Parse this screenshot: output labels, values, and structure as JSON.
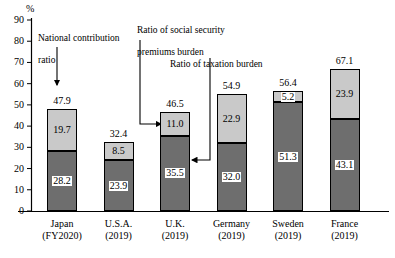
{
  "chart_data": {
    "type": "bar",
    "subtype": "stacked-column",
    "title": "",
    "xlabel": "",
    "ylabel": "%",
    "ylim": [
      0,
      90
    ],
    "yticks": [
      0,
      10,
      20,
      30,
      40,
      50,
      60,
      70,
      80,
      90
    ],
    "grid": false,
    "legend_position": "annotations",
    "categories": [
      "Japan",
      "U.S.A.",
      "U.K.",
      "Germany",
      "Sweden",
      "France"
    ],
    "category_years": [
      "(FY2020)",
      "(2019)",
      "(2019)",
      "(2019)",
      "(2019)",
      "(2019)"
    ],
    "series": [
      {
        "name": "Ratio of taxation burden",
        "key": "taxation",
        "color": "#6e6e6e",
        "values": [
          28.2,
          23.9,
          35.5,
          32.0,
          51.3,
          43.1
        ]
      },
      {
        "name": "Ratio of social security premiums burden",
        "key": "social_security",
        "color": "#c9c9c9",
        "values": [
          19.7,
          8.5,
          11.0,
          22.9,
          5.2,
          23.9
        ]
      }
    ],
    "totals": [
      47.9,
      32.4,
      46.5,
      54.9,
      56.4,
      67.1
    ],
    "total_label_name": "National contribution ratio",
    "annotations": [
      {
        "id": "national-contribution-ratio",
        "text": "National contribution\nratio"
      },
      {
        "id": "social-security-premiums-burden",
        "text": "Ratio of social security\npremiums burden"
      },
      {
        "id": "taxation-burden",
        "text": "Ratio of taxation burden"
      }
    ]
  },
  "axis": {
    "unit": "%",
    "ticks": [
      "90",
      "80",
      "70",
      "60",
      "50",
      "40",
      "30",
      "20",
      "10",
      "0"
    ]
  },
  "bars": [
    {
      "name": "Japan",
      "year": "(FY2020)",
      "total": "47.9",
      "light": "19.7",
      "dark": "28.2"
    },
    {
      "name": "U.S.A.",
      "year": "(2019)",
      "total": "32.4",
      "light": "8.5",
      "dark": "23.9"
    },
    {
      "name": "U.K.",
      "year": "(2019)",
      "total": "46.5",
      "light": "11.0",
      "dark": "35.5"
    },
    {
      "name": "Germany",
      "year": "(2019)",
      "total": "54.9",
      "light": "22.9",
      "dark": "32.0"
    },
    {
      "name": "Sweden",
      "year": "(2019)",
      "total": "56.4",
      "light": "5.2",
      "dark": "51.3"
    },
    {
      "name": "France",
      "year": "(2019)",
      "total": "67.1",
      "light": "23.9",
      "dark": "43.1"
    }
  ],
  "annotations": {
    "national": {
      "line1": "National contribution",
      "line2": "ratio"
    },
    "social": {
      "line1": "Ratio of social security",
      "line2": "premiums burden"
    },
    "tax": {
      "line1": "Ratio of taxation burden",
      "line2": ""
    }
  },
  "colors": {
    "light_segment": "#c9c9c9",
    "dark_segment": "#6e6e6e",
    "axis": "#000000",
    "background": "#ffffff"
  }
}
